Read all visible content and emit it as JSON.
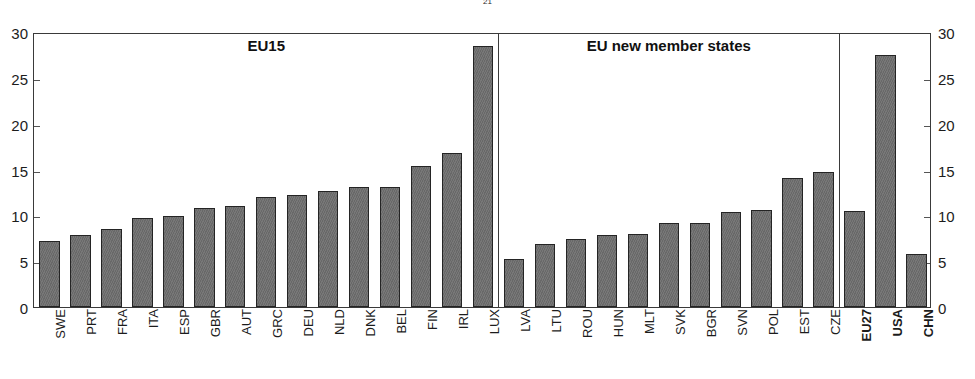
{
  "figure": {
    "title_fragment_prefix": "",
    "title_fragment_sub1": "2",
    "title_fragment_mid": "",
    "title_fragment_sub2": "1",
    "title_fragment_suffix": ""
  },
  "axis": {
    "y_ticks": [
      "0",
      "5",
      "10",
      "15",
      "20",
      "25",
      "30"
    ],
    "y_min": 0,
    "y_max": 30
  },
  "sections": [
    {
      "label": "EU15",
      "start_index": 0,
      "end_index": 15
    },
    {
      "label": "EU new member states",
      "start_index": 16,
      "end_index": 27
    },
    {
      "label": "",
      "start_index": 28,
      "end_index": 30
    }
  ],
  "colors": {
    "bar_fill": "#6e6e6e",
    "bar_stroke": "#242424",
    "axis": "#3a3a3a",
    "text": "#1c1c1c",
    "background": "#ffffff"
  },
  "chart_data": {
    "type": "bar",
    "title": "",
    "subtitle": "",
    "xlabel": "",
    "ylabel": "",
    "ylim": [
      0,
      30
    ],
    "grid": false,
    "legend": null,
    "categories": [
      "SWE",
      "PRT",
      "FRA",
      "ITA",
      "ESP",
      "GBR",
      "AUT",
      "GRC",
      "DEU",
      "NLD",
      "DNK",
      "BEL",
      "FIN",
      "IRL",
      "LUX",
      "LVA",
      "LTU",
      "ROU",
      "HUN",
      "MLT",
      "SVK",
      "BGR",
      "SVN",
      "POL",
      "EST",
      "CZE",
      "EU27",
      "USA",
      "CHN"
    ],
    "values": [
      7.2,
      7.9,
      8.5,
      9.7,
      9.9,
      10.8,
      11.0,
      12.0,
      12.2,
      12.7,
      13.1,
      13.1,
      15.4,
      16.8,
      28.5,
      5.2,
      6.9,
      7.4,
      7.9,
      8.0,
      9.2,
      9.2,
      10.4,
      10.6,
      14.1,
      14.7,
      10.5,
      27.5,
      5.8
    ],
    "bold_categories": [
      "EU27",
      "USA",
      "CHN"
    ],
    "group_boundaries_after": [
      "LUX",
      "CZE"
    ],
    "groups": [
      {
        "label": "EU15",
        "categories": [
          "SWE",
          "PRT",
          "FRA",
          "ITA",
          "ESP",
          "GBR",
          "AUT",
          "GRC",
          "DEU",
          "NLD",
          "DNK",
          "BEL",
          "FIN",
          "IRL",
          "LUX"
        ]
      },
      {
        "label": "EU new member states",
        "categories": [
          "LVA",
          "LTU",
          "ROU",
          "HUN",
          "MLT",
          "SVK",
          "BGR",
          "SVN",
          "POL",
          "EST",
          "CZE"
        ]
      },
      {
        "label": "",
        "categories": [
          "EU27",
          "USA",
          "CHN"
        ]
      }
    ]
  }
}
